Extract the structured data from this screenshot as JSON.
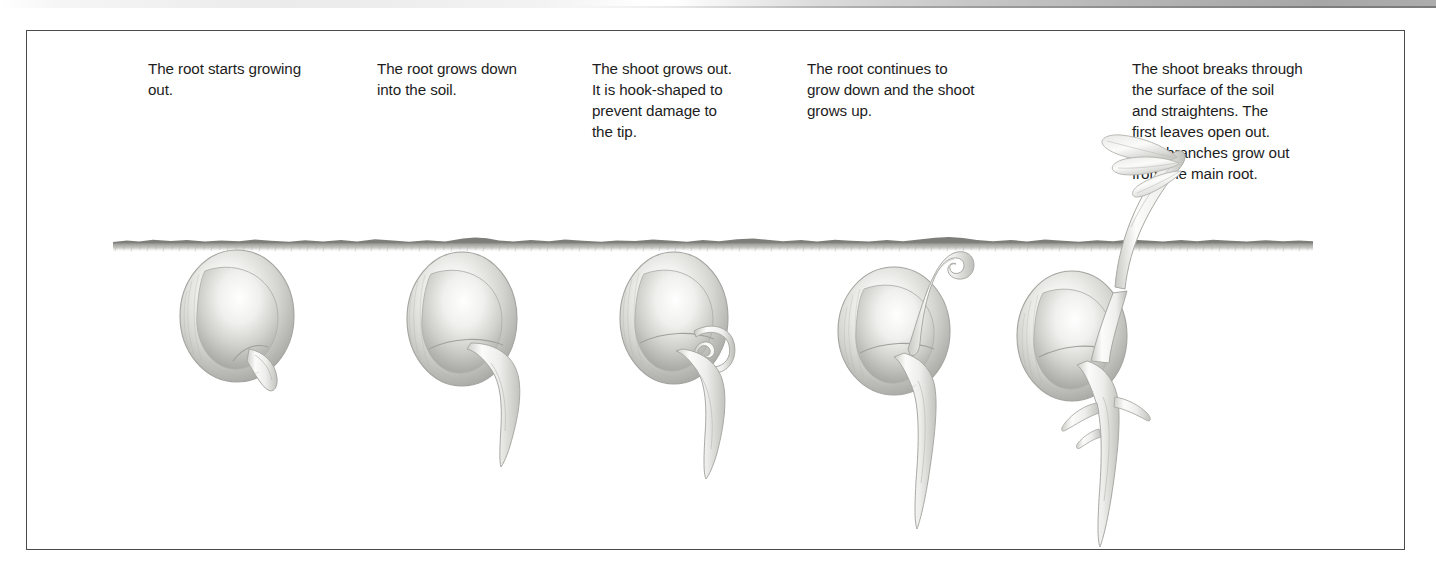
{
  "document": {
    "type": "illustration-diagram",
    "subject": "Bean seed germination sequence",
    "frame_color": "#4a4a4a",
    "background_color": "#ffffff",
    "text_color": "#1d1d1d",
    "pencil_color": "#b9b9b5"
  },
  "captions": [
    {
      "id": "stage-1",
      "text": "The root starts growing\nout."
    },
    {
      "id": "stage-2",
      "text": "The root grows down\ninto the soil."
    },
    {
      "id": "stage-3",
      "text": "The shoot grows out.\nIt is hook-shaped to\nprevent damage to\nthe tip."
    },
    {
      "id": "stage-4",
      "text": "The root continues to\ngrow down and the shoot\ngrows up."
    },
    {
      "id": "stage-5",
      "text": "The shoot breaks through\nthe surface of the soil\nand straightens. The\nfirst leaves open out.\nSide branches grow out\nfrom the main root."
    }
  ],
  "stages": [
    {
      "id": "stage-1",
      "name": "seed-with-emerging-radicle",
      "caption_x": 147,
      "caption_y": 57,
      "art_x": 110
    },
    {
      "id": "stage-2",
      "name": "seed-with-downward-root",
      "caption_x": 376,
      "caption_y": 57,
      "art_x": 340
    },
    {
      "id": "stage-3",
      "name": "seed-with-hooked-shoot",
      "caption_x": 591,
      "caption_y": 57,
      "art_x": 555
    },
    {
      "id": "stage-4",
      "name": "seedling-shoot-reaching-surface",
      "caption_x": 806,
      "caption_y": 57,
      "art_x": 775
    },
    {
      "id": "stage-5",
      "name": "seedling-emerged-with-leaves",
      "caption_x": 1131,
      "caption_y": 57,
      "art_x": 985
    }
  ],
  "soil": {
    "name": "soil-surface-line",
    "label": "soil surface",
    "y": 240
  }
}
